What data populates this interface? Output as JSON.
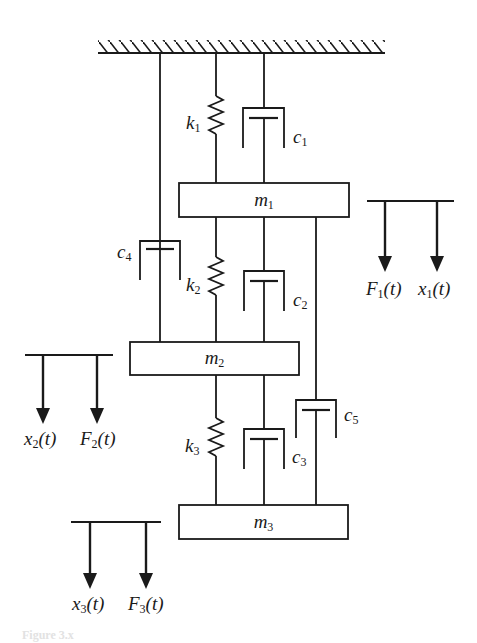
{
  "figure": {
    "type": "three-degree-of-freedom spring-mass-damper system",
    "caption": "Figure 3.x",
    "colors": {
      "stroke": "#1a1a1a",
      "background": "#ffffff"
    }
  },
  "masses": [
    {
      "id": "m1",
      "symbol": "m",
      "subscript": "1"
    },
    {
      "id": "m2",
      "symbol": "m",
      "subscript": "2"
    },
    {
      "id": "m3",
      "symbol": "m",
      "subscript": "3"
    }
  ],
  "springs": [
    {
      "id": "k1",
      "symbol": "k",
      "subscript": "1",
      "connects": "ground-m1"
    },
    {
      "id": "k2",
      "symbol": "k",
      "subscript": "2",
      "connects": "m1-m2"
    },
    {
      "id": "k3",
      "symbol": "k",
      "subscript": "3",
      "connects": "m2-m3"
    }
  ],
  "dampers": [
    {
      "id": "c1",
      "symbol": "c",
      "subscript": "1",
      "connects": "ground-m1"
    },
    {
      "id": "c2",
      "symbol": "c",
      "subscript": "2",
      "connects": "m1-m2"
    },
    {
      "id": "c3",
      "symbol": "c",
      "subscript": "3",
      "connects": "m2-m3"
    },
    {
      "id": "c4",
      "symbol": "c",
      "subscript": "4",
      "connects": "ground-m2"
    },
    {
      "id": "c5",
      "symbol": "c",
      "subscript": "5",
      "connects": "m1-m3"
    }
  ],
  "forces_and_displacements": [
    {
      "group": "mass1",
      "labels": [
        {
          "symbol": "F",
          "subscript": "1",
          "arg": "(t)"
        },
        {
          "symbol": "x",
          "subscript": "1",
          "arg": "(t)"
        }
      ]
    },
    {
      "group": "mass2",
      "labels": [
        {
          "symbol": "x",
          "subscript": "2",
          "arg": "(t)"
        },
        {
          "symbol": "F",
          "subscript": "2",
          "arg": "(t)"
        }
      ]
    },
    {
      "group": "mass3",
      "labels": [
        {
          "symbol": "x",
          "subscript": "3",
          "arg": "(t)"
        },
        {
          "symbol": "F",
          "subscript": "3",
          "arg": "(t)"
        }
      ]
    }
  ]
}
